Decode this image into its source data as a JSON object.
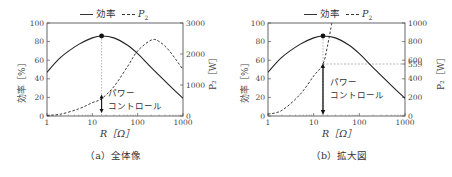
{
  "chart_data": [
    {
      "type": "line",
      "caption": "（a）全体像",
      "legend": [
        "効率",
        "P₂"
      ],
      "xlabel": "R [Ω]",
      "ylabel_left": "効率 [%]",
      "ylabel_right": "P₂ [W]",
      "xscale": "log",
      "xlim": [
        1,
        1000
      ],
      "ylim_left": [
        0,
        100
      ],
      "ylim_right": [
        0,
        3000
      ],
      "xticks": [
        "1",
        "10",
        "100",
        "1000"
      ],
      "yticks_left": [
        "0",
        "20",
        "40",
        "60",
        "80",
        "100"
      ],
      "yticks_right": [
        "0",
        "1000",
        "2000",
        "3000"
      ],
      "series": [
        {
          "name": "効率",
          "style": "solid",
          "axis": "left",
          "x": [
            1,
            2,
            5,
            10,
            16,
            30,
            60,
            100,
            200,
            500,
            1000
          ],
          "y": [
            47,
            63,
            77,
            84,
            86,
            84,
            76,
            67,
            52,
            33,
            19
          ]
        },
        {
          "name": "P₂",
          "style": "dashed",
          "axis": "right",
          "x": [
            1,
            2,
            5,
            10,
            16,
            30,
            60,
            100,
            200,
            300,
            500,
            1000
          ],
          "y": [
            20,
            60,
            230,
            430,
            560,
            950,
            1600,
            2100,
            2450,
            2400,
            2100,
            1500
          ]
        }
      ],
      "annotations": [
        {
          "text": "パワーコントロール",
          "type": "double-arrow",
          "x": 16
        },
        {
          "type": "vline-dashed",
          "x": 16
        },
        {
          "type": "marker",
          "x": 16,
          "y": 86
        }
      ]
    },
    {
      "type": "line",
      "caption": "（b）拡大図",
      "legend": [
        "効率",
        "P₂"
      ],
      "xlabel": "R [Ω]",
      "ylabel_left": "効率 [%]",
      "ylabel_right": "P₂ [W]",
      "xscale": "log",
      "xlim": [
        1,
        1000
      ],
      "ylim_left": [
        0,
        100
      ],
      "ylim_right": [
        0,
        1000
      ],
      "xticks": [
        "1",
        "10",
        "100",
        "1000"
      ],
      "yticks_left": [
        "0",
        "20",
        "40",
        "60",
        "80",
        "100"
      ],
      "yticks_right": [
        "0",
        "200",
        "400",
        "559",
        "600",
        "800",
        "1000"
      ],
      "series": [
        {
          "name": "効率",
          "style": "solid",
          "axis": "left",
          "x": [
            1,
            2,
            5,
            10,
            16,
            30,
            60,
            100,
            200,
            500,
            1000
          ],
          "y": [
            47,
            63,
            77,
            84,
            86,
            84,
            76,
            67,
            52,
            33,
            19
          ]
        },
        {
          "name": "P₂",
          "style": "dashed",
          "axis": "right",
          "x": [
            1,
            2,
            5,
            10,
            16,
            20,
            25
          ],
          "y": [
            20,
            60,
            230,
            430,
            559,
            750,
            1000
          ]
        }
      ],
      "annotations": [
        {
          "text": "パワーコントロール",
          "type": "arrow-down",
          "x": 16
        },
        {
          "type": "hline-dashed",
          "y_right": 559
        },
        {
          "type": "vline-dashed",
          "x": 16
        },
        {
          "type": "marker",
          "x": 16,
          "y": 86
        }
      ]
    }
  ],
  "panels": [
    {
      "legend_eff": "効率",
      "legend_p2": "P",
      "legend_p2_sub": "2",
      "ylabel_left": "効率［%］",
      "ylabel_right": "P₂［W］",
      "xlabel": "R［Ω］",
      "annot_line1": "パワー",
      "annot_line2": "コントロール",
      "caption": "（a）全体像"
    },
    {
      "legend_eff": "効率",
      "legend_p2": "P",
      "legend_p2_sub": "2",
      "ylabel_left": "効率［%］",
      "ylabel_right": "P₂［W］",
      "xlabel": "R［Ω］",
      "annot_line1": "パワー",
      "annot_line2": "コントロール",
      "caption": "（b）拡大図"
    }
  ]
}
